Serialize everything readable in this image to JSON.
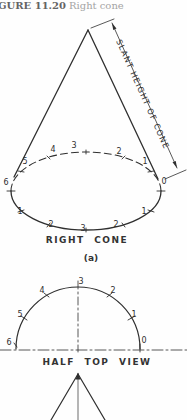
{
  "caption": {
    "figure_label": "GURE 11.20",
    "figure_title": "Right cone"
  },
  "cone_view": {
    "dimension_label": "SLANT HEIGHT OF CONE",
    "name": "RIGHT CONE",
    "tag": "(a)",
    "top_labels": [
      "5",
      "4",
      "3",
      "2",
      "1"
    ],
    "left_label": "6",
    "right_label": "0",
    "bottom_labels": [
      "1",
      "2",
      "3",
      "2",
      "1"
    ]
  },
  "half_top_view": {
    "name": "HALF TOP VIEW",
    "arc_labels": [
      "6",
      "5",
      "4",
      "3",
      "2",
      "1",
      "0"
    ]
  },
  "colors": {
    "line": "#2f2f2f",
    "caption_label": "#646464",
    "caption_title": "#a4a4a4"
  }
}
